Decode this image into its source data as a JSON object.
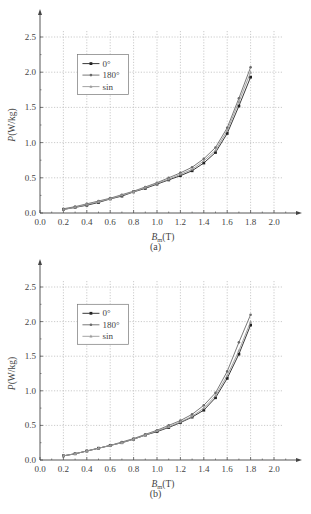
{
  "chart_data": [
    {
      "type": "line",
      "panel": "(a)",
      "title": "",
      "xlabel": "B_m (T)",
      "ylabel": "P (W/kg)",
      "xlim": [
        0.0,
        2.2
      ],
      "ylim": [
        0.0,
        2.7
      ],
      "xticks": [
        "0.0",
        "0.2",
        "0.4",
        "0.6",
        "0.8",
        "1.0",
        "1.2",
        "1.4",
        "1.6",
        "1.8",
        "2.0"
      ],
      "yticks": [
        "0.0",
        "0.5",
        "1.0",
        "1.5",
        "2.0",
        "2.5"
      ],
      "grid": true,
      "legend_position": "upper-left",
      "x": [
        0.2,
        0.3,
        0.4,
        0.5,
        0.6,
        0.7,
        0.8,
        0.9,
        1.0,
        1.1,
        1.2,
        1.3,
        1.4,
        1.5,
        1.6,
        1.7,
        1.8
      ],
      "series": [
        {
          "name": "0°",
          "marker": "square",
          "values": [
            0.05,
            0.08,
            0.11,
            0.15,
            0.2,
            0.24,
            0.3,
            0.35,
            0.41,
            0.47,
            0.53,
            0.6,
            0.71,
            0.86,
            1.13,
            1.52,
            1.93
          ]
        },
        {
          "name": "180°",
          "marker": "circle",
          "values": [
            0.06,
            0.09,
            0.13,
            0.17,
            0.21,
            0.26,
            0.31,
            0.37,
            0.43,
            0.5,
            0.57,
            0.65,
            0.77,
            0.93,
            1.21,
            1.63,
            2.07
          ]
        },
        {
          "name": "sin",
          "marker": "triangle",
          "values": [
            0.05,
            0.08,
            0.12,
            0.16,
            0.2,
            0.25,
            0.3,
            0.36,
            0.42,
            0.48,
            0.55,
            0.62,
            0.74,
            0.89,
            1.17,
            1.58,
            2.0
          ]
        }
      ]
    },
    {
      "type": "line",
      "panel": "(b)",
      "title": "",
      "xlabel": "B_m (T)",
      "ylabel": "P (W/kg)",
      "xlim": [
        0.0,
        2.2
      ],
      "ylim": [
        0.0,
        2.7
      ],
      "xticks": [
        "0.0",
        "0.2",
        "0.4",
        "0.6",
        "0.8",
        "1.0",
        "1.2",
        "1.4",
        "1.6",
        "1.8",
        "2.0"
      ],
      "yticks": [
        "0.0",
        "0.5",
        "1.0",
        "1.5",
        "2.0",
        "2.5"
      ],
      "grid": true,
      "legend_position": "upper-left",
      "x": [
        0.2,
        0.3,
        0.4,
        0.5,
        0.6,
        0.7,
        0.8,
        0.9,
        1.0,
        1.1,
        1.2,
        1.3,
        1.4,
        1.5,
        1.6,
        1.7,
        1.8
      ],
      "series": [
        {
          "name": "0°",
          "marker": "square",
          "values": [
            0.06,
            0.09,
            0.13,
            0.17,
            0.21,
            0.25,
            0.3,
            0.36,
            0.41,
            0.47,
            0.54,
            0.62,
            0.72,
            0.9,
            1.18,
            1.53,
            1.95
          ]
        },
        {
          "name": "180°",
          "marker": "circle",
          "values": [
            0.06,
            0.09,
            0.13,
            0.17,
            0.21,
            0.26,
            0.31,
            0.37,
            0.43,
            0.5,
            0.57,
            0.66,
            0.79,
            0.97,
            1.28,
            1.7,
            2.1
          ]
        },
        {
          "name": "sin",
          "marker": "triangle",
          "values": [
            0.06,
            0.09,
            0.13,
            0.17,
            0.21,
            0.25,
            0.3,
            0.36,
            0.42,
            0.48,
            0.55,
            0.63,
            0.75,
            0.93,
            1.22,
            1.58,
            2.0
          ]
        }
      ]
    }
  ],
  "captions": {
    "a": "(a)",
    "b": "(b)"
  },
  "axis_labels": {
    "x_main": "B",
    "x_sub": "m",
    "x_unit": "(T)",
    "y": "P (W/kg)"
  },
  "colors": {
    "axis": "#444444",
    "grid": "#b5b5b5",
    "s0": "#222222",
    "s180": "#6a6a6a",
    "ssin": "#9a9a9a"
  }
}
